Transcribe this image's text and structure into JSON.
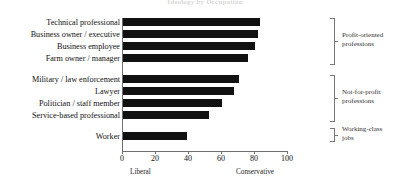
{
  "chart_data": {
    "type": "bar",
    "orientation": "horizontal",
    "title": "Ideology by Occupation",
    "categories": [
      "Technical professional",
      "Business owner / executive",
      "Business employee",
      "Farm owner / manager",
      "Military / law enforcement",
      "Lawyer",
      "Politician / staff member",
      "Service-based professional",
      "Worker"
    ],
    "values": [
      83,
      82,
      80,
      76,
      70,
      67,
      60,
      52,
      39
    ],
    "xlabel": "",
    "ylabel": "",
    "xlim": [
      0,
      100
    ],
    "xticks": [
      0,
      20,
      40,
      60,
      80,
      100
    ],
    "xtick_labels": [
      "0",
      "20",
      "40",
      "60",
      "80",
      "100"
    ],
    "axis_end_labels": {
      "left": "Liberal",
      "right": "Conservative"
    },
    "grid": false,
    "legend": "none",
    "bar_color": "#111111",
    "groups": [
      {
        "label": "Profit-oriented professions",
        "label_line1": "Profit-oriented",
        "label_line2": "professions",
        "members": [
          "Technical professional",
          "Business owner / executive",
          "Business employee",
          "Farm owner / manager"
        ]
      },
      {
        "label": "Not-for-profit professions",
        "label_line1": "Not-for-profit",
        "label_line2": "professions",
        "members": [
          "Military / law enforcement",
          "Lawyer",
          "Politician / staff member",
          "Service-based professional"
        ]
      },
      {
        "label": "Working-class jobs",
        "label_line1": "Working-class",
        "label_line2": "jobs",
        "members": [
          "Worker"
        ]
      }
    ]
  }
}
